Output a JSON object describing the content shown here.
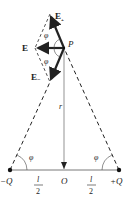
{
  "diagram": {
    "labels": {
      "e_plus": "E",
      "e_plus_sub": "+",
      "e_net": "E",
      "e_minus": "E",
      "e_minus_sub": "−",
      "point_p": "P",
      "phi_upper": "φ",
      "phi_lower": "φ",
      "phi_left": "φ",
      "phi_right": "φ",
      "distance_r": "r",
      "neg_charge": "−Q",
      "pos_charge": "+Q",
      "origin": "O",
      "half_l_left_num": "l",
      "half_l_left_den": "2",
      "half_l_right_num": "l",
      "half_l_right_den": "2"
    },
    "colors": {
      "line": "#222222",
      "thin_line": "#555555"
    }
  }
}
